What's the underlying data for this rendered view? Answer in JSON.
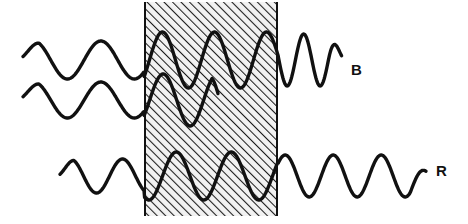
{
  "figure": {
    "background_color": "#ffffff",
    "stroke_color": "#111111"
  },
  "slab": {
    "name": "hatched-medium",
    "x": 144,
    "y": 2,
    "width": 134,
    "height": 214,
    "fill_color": "#f0f0f0",
    "hatch_color": "#1a1a1a",
    "hatch_angle_deg": 45,
    "border_color": "#111111"
  },
  "labels": {
    "b": "B",
    "r": "R"
  },
  "chart_data": {
    "type": "line",
    "xlabel": "",
    "ylabel": "",
    "xlim": [
      0,
      468
    ],
    "ylim": [
      224,
      0
    ],
    "grid": false,
    "legend": "right-of-curves",
    "annotations": [
      {
        "text": "B",
        "x": 355,
        "y": 70
      },
      {
        "text": "R",
        "x": 440,
        "y": 170
      }
    ],
    "regions": [
      {
        "name": "slab",
        "x0": 144,
        "x1": 278,
        "fill": "hatched-45deg"
      }
    ],
    "series": [
      {
        "name": "B-wave-upper",
        "baseline_y": 60,
        "amplitude_outside_left": 19,
        "wavelength_outside_left": 67,
        "amplitude_inside": 28,
        "wavelength_inside": 52,
        "amplitude_outside_right": 26,
        "wavelength_outside_right": 33,
        "x_start": 23,
        "x_end": 342
      },
      {
        "name": "B-wave-lower",
        "baseline_y": 100,
        "amplitude_outside_left": 18,
        "wavelength_outside_left": 67,
        "amplitude_inside": 26,
        "wavelength_inside": 54,
        "x_start": 23,
        "x_end": 218
      },
      {
        "name": "R-wave",
        "baseline_y": 176,
        "amplitude_outside_left": 17,
        "wavelength_outside_left": 52,
        "amplitude_inside": 24,
        "wavelength_inside": 55,
        "amplitude_outside_right": 21,
        "wavelength_outside_right": 48,
        "x_start": 60,
        "x_end": 426
      }
    ]
  }
}
